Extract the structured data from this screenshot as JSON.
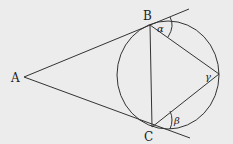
{
  "diagram": {
    "title": "",
    "background_color": "#ececec",
    "circle_fill": "#ffffff",
    "stroke_color": "#333333",
    "points": {
      "A": {
        "label": "A",
        "x": 24,
        "y": 77
      },
      "B": {
        "label": "B",
        "x": 150,
        "y": 25
      },
      "C": {
        "label": "C",
        "x": 152,
        "y": 127
      },
      "D": {
        "label": "",
        "x": 219,
        "y": 74
      }
    },
    "circle": {
      "cx": 168,
      "cy": 75,
      "rx": 51,
      "ry": 54
    },
    "angles": {
      "alpha": {
        "label": "α"
      },
      "beta": {
        "label": "β"
      },
      "gamma": {
        "label": "γ"
      }
    }
  }
}
